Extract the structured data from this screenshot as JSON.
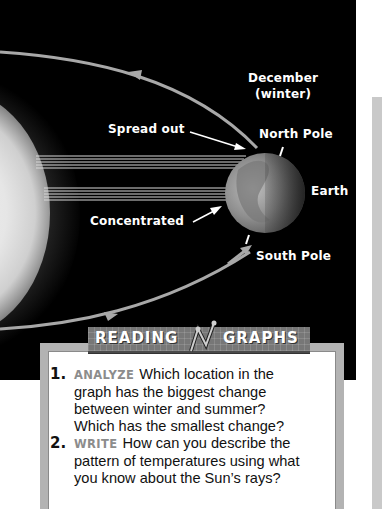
{
  "diagram": {
    "labels": {
      "december": "December",
      "winter": "(winter)",
      "spread_out": "Spread out",
      "north_pole": "North Pole",
      "earth": "Earth",
      "concentrated": "Concentrated",
      "south_pole": "South Pole"
    },
    "colors": {
      "background": "#000000",
      "label": "#ffffff",
      "orbit": "#a8a8a8",
      "rays": "#d9d9d9"
    }
  },
  "reading_graphs": {
    "title_word1": "READING",
    "title_word2": "GRAPHS",
    "questions": [
      {
        "number": "1.",
        "tag": "ANALYZE",
        "lines": [
          "Which location in the",
          "graph has the biggest change",
          "between winter and summer?",
          "Which has the smallest change?"
        ]
      },
      {
        "number": "2.",
        "tag": "WRITE",
        "lines": [
          "How can you describe the",
          "pattern of temperatures using what",
          "you know about the Sun’s rays?"
        ]
      }
    ]
  }
}
